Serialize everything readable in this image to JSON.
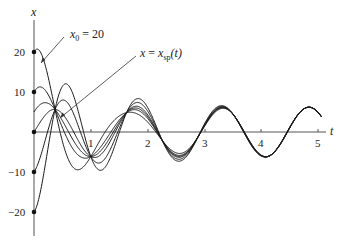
{
  "chart_data": {
    "type": "line",
    "title": "",
    "xlabel": "t",
    "ylabel": "x",
    "xlim": [
      0,
      5.2
    ],
    "ylim": [
      -25,
      27
    ],
    "x_ticks": [
      1,
      2,
      3,
      4,
      5
    ],
    "x_tick_labels": [
      "1",
      "2",
      "3",
      "4",
      "5"
    ],
    "y_ticks": [
      20,
      10,
      -10,
      -20
    ],
    "y_tick_labels": [
      "20",
      "10",
      "−10",
      "−20"
    ],
    "grid": false,
    "legend": null,
    "initial_values": [
      20,
      10,
      5,
      0,
      -10,
      -20
    ],
    "steady_state": {
      "name": "x = x_sp(t)",
      "amplitude": 6.2,
      "angular_frequency": 4.13,
      "zero_crossings_t": [
        2.17,
        2.93,
        3.69,
        4.45
      ]
    },
    "transient_model": {
      "decay_rate": 1.2,
      "natural_frequency": 5.0,
      "common_crossing_points_t": [
        0.37,
        1.0
      ]
    },
    "series": [
      {
        "name": "x0 = 20",
        "x0": 20
      },
      {
        "name": "x0 = 10",
        "x0": 10
      },
      {
        "name": "x0 = 5",
        "x0": 5
      },
      {
        "name": "x0 = 0",
        "x0": 0
      },
      {
        "name": "x0 = -10",
        "x0": -10
      },
      {
        "name": "x0 = -20",
        "x0": -20
      }
    ],
    "annotations": [
      {
        "text": "x0 = 20",
        "points_to": "curve starting at x = 20"
      },
      {
        "text": "x = x_sp(t)",
        "points_to": "steady-state solution"
      }
    ]
  },
  "labels": {
    "x_axis": "t",
    "y_axis": "x",
    "annot_x0_main": "x",
    "annot_x0_sub": "0",
    "annot_x0_rest": " = 20",
    "annot_sp_lhs": "x",
    "annot_sp_eq": " = ",
    "annot_sp_x": "x",
    "annot_sp_sub": "sp",
    "annot_sp_arg": "(t)",
    "ticks_x": [
      "1",
      "2",
      "3",
      "4",
      "5"
    ],
    "ticks_y": [
      "20",
      "10",
      "−10",
      "−20"
    ]
  },
  "style": {
    "line_color": "#1a1a1a",
    "axis_color": "#555555"
  }
}
